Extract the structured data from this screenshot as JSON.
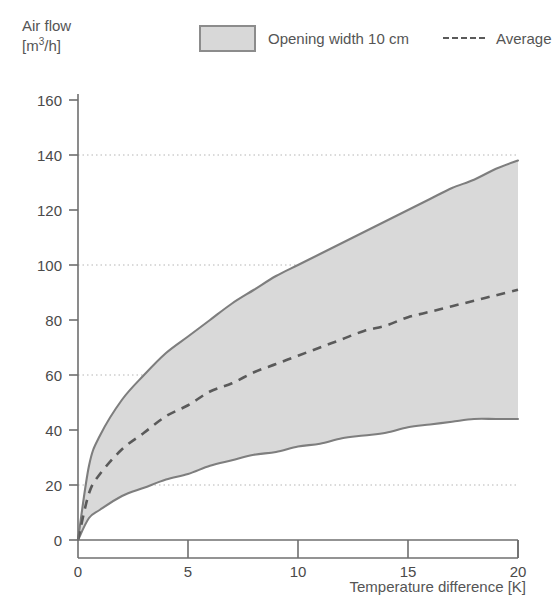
{
  "chart_data": {
    "type": "area",
    "title": "",
    "ylabel_line1": "Air flow",
    "ylabel_line2_prefix": "[m",
    "ylabel_line2_sup": "3",
    "ylabel_line2_suffix": "/h]",
    "xlabel": "Temperature difference [K]",
    "xlim": [
      0,
      20
    ],
    "ylim": [
      0,
      160
    ],
    "xticks": [
      0,
      5,
      10,
      15,
      20
    ],
    "yticks": [
      0,
      20,
      40,
      60,
      80,
      100,
      120,
      140,
      160
    ],
    "xtick_labels": [
      "0",
      "5",
      "10",
      "15",
      "20"
    ],
    "ytick_labels": [
      "0",
      "20",
      "40",
      "60",
      "80",
      "100",
      "120",
      "140",
      "160"
    ],
    "grid": "horizontal dotted at 20, 60, 100, 140",
    "gridlines_y": [
      20,
      60,
      100,
      140
    ],
    "legend_position": "top",
    "legend": [
      {
        "name": "Opening width 10 cm",
        "marker": "filled-rect",
        "color": "#d8d8d8",
        "border": "#8c8c8c"
      },
      {
        "name": "Average",
        "marker": "dashed-line",
        "color": "#5a5a5a"
      }
    ],
    "x": [
      0,
      0.5,
      1,
      2,
      3,
      4,
      5,
      6,
      7,
      8,
      9,
      10,
      11,
      12,
      13,
      14,
      15,
      16,
      17,
      18,
      19,
      20
    ],
    "series": [
      {
        "name": "Opening width 10 cm (upper bound)",
        "values": [
          0,
          27,
          38,
          51,
          60,
          68,
          74,
          80,
          86,
          91,
          96,
          100,
          104,
          108,
          112,
          116,
          120,
          124,
          128,
          131,
          135,
          138
        ]
      },
      {
        "name": "Average",
        "values": [
          0,
          17,
          24,
          33,
          39,
          45,
          49,
          54,
          57,
          61,
          64,
          67,
          70,
          73,
          76,
          78,
          81,
          83,
          85,
          87,
          89,
          91
        ]
      },
      {
        "name": "Opening width 10 cm (lower bound)",
        "values": [
          0,
          8,
          11,
          16,
          19,
          22,
          24,
          27,
          29,
          31,
          32,
          34,
          35,
          37,
          38,
          39,
          41,
          42,
          43,
          44,
          44,
          44
        ]
      }
    ],
    "annotations": {
      "upper_crosses_100_at_K": 10.5,
      "average_crosses_60_at_K": 8.5,
      "lower_crosses_20_at_K": 3.3
    },
    "colors": {
      "band_fill": "#d9d9d9",
      "band_edge": "#7e7e7e",
      "average_line": "#5a5a5a",
      "axis": "#6f6f6f",
      "gridline": "#b5b5b5",
      "text": "#4a4a4a",
      "background": "#ffffff"
    }
  }
}
